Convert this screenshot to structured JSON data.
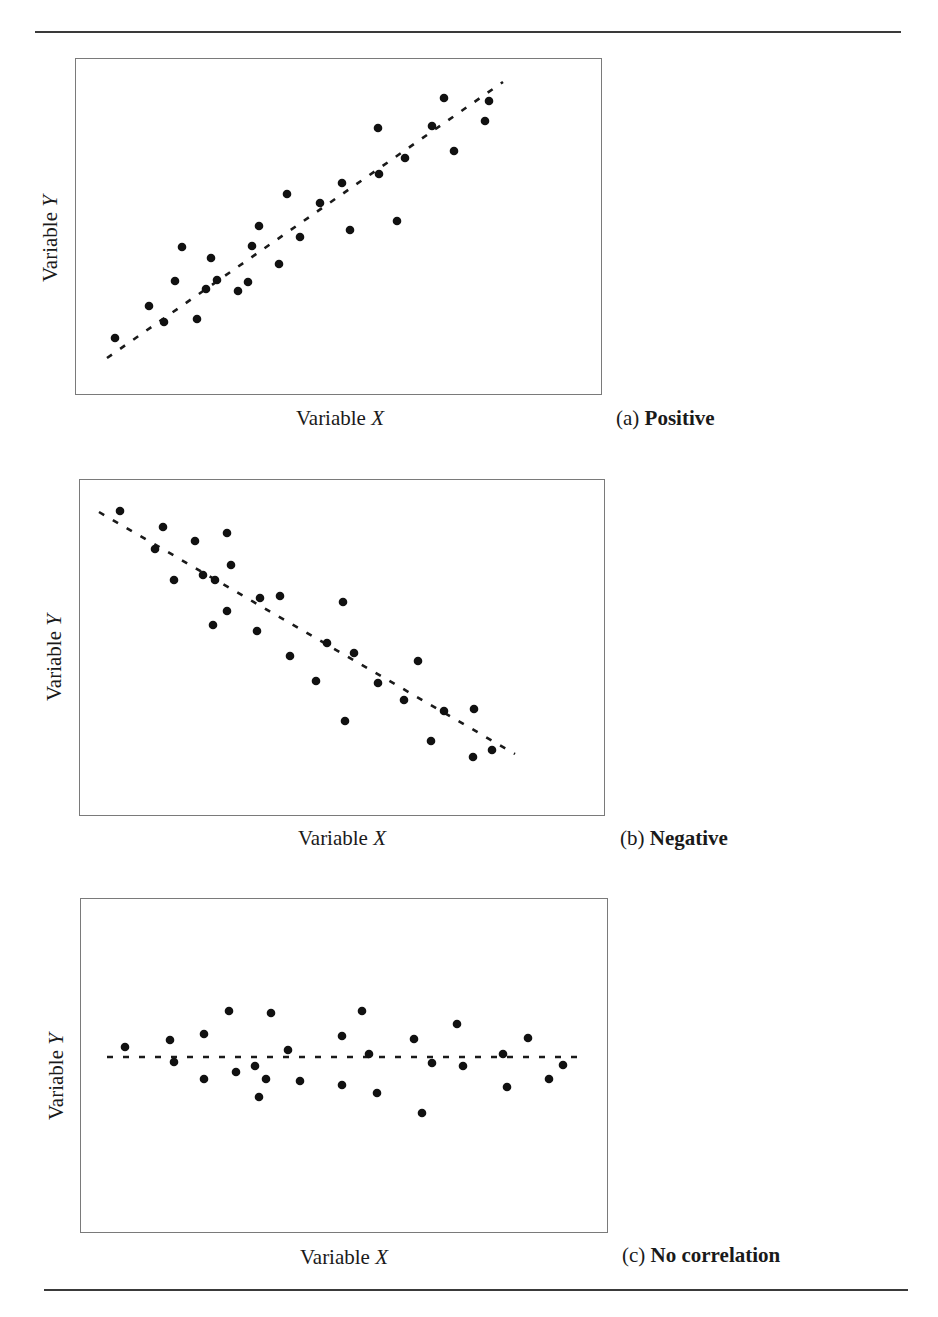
{
  "figure": {
    "panels": [
      {
        "id": "a",
        "caption_letter": "(a)",
        "caption_text": "Positive",
        "xlabel_prefix": "Variable ",
        "xlabel_var": "X",
        "ylabel_prefix": "Variable ",
        "ylabel_var": "Y"
      },
      {
        "id": "b",
        "caption_letter": "(b)",
        "caption_text": "Negative",
        "xlabel_prefix": "Variable ",
        "xlabel_var": "X",
        "ylabel_prefix": "Variable ",
        "ylabel_var": "Y"
      },
      {
        "id": "c",
        "caption_letter": "(c)",
        "caption_text": "No correlation",
        "xlabel_prefix": "Variable ",
        "xlabel_var": "X",
        "ylabel_prefix": "Variable ",
        "ylabel_var": "Y"
      }
    ]
  },
  "chart_data": [
    {
      "type": "scatter",
      "title": "(a) Positive",
      "xlabel": "Variable X",
      "ylabel": "Variable Y",
      "grid": false,
      "box": {
        "x": 75,
        "y": 58,
        "w": 527,
        "h": 337
      },
      "trendline": {
        "style": "dashed",
        "x1": 107,
        "y1": 358,
        "x2": 503,
        "y2": 82
      },
      "points_px": [
        [
          115,
          338
        ],
        [
          149,
          306
        ],
        [
          164,
          322
        ],
        [
          175,
          281
        ],
        [
          182,
          247
        ],
        [
          197,
          319
        ],
        [
          206,
          289
        ],
        [
          211,
          258
        ],
        [
          217,
          280
        ],
        [
          238,
          291
        ],
        [
          248,
          282
        ],
        [
          252,
          246
        ],
        [
          259,
          226
        ],
        [
          279,
          264
        ],
        [
          287,
          194
        ],
        [
          300,
          237
        ],
        [
          320,
          203
        ],
        [
          342,
          183
        ],
        [
          350,
          230
        ],
        [
          378,
          128
        ],
        [
          379,
          174
        ],
        [
          397,
          221
        ],
        [
          405,
          158
        ],
        [
          432,
          126
        ],
        [
          444,
          98
        ],
        [
          454,
          151
        ],
        [
          485,
          121
        ],
        [
          489,
          101
        ]
      ]
    },
    {
      "type": "scatter",
      "title": "(b) Negative",
      "xlabel": "Variable X",
      "ylabel": "Variable Y",
      "grid": false,
      "box": {
        "x": 79,
        "y": 479,
        "w": 526,
        "h": 337
      },
      "trendline": {
        "style": "dashed",
        "x1": 99,
        "y1": 512,
        "x2": 515,
        "y2": 754
      },
      "points_px": [
        [
          120,
          511
        ],
        [
          155,
          549
        ],
        [
          163,
          527
        ],
        [
          174,
          580
        ],
        [
          195,
          541
        ],
        [
          203,
          575
        ],
        [
          213,
          625
        ],
        [
          215,
          580
        ],
        [
          227,
          533
        ],
        [
          227,
          611
        ],
        [
          231,
          565
        ],
        [
          257,
          631
        ],
        [
          260,
          598
        ],
        [
          280,
          596
        ],
        [
          290,
          656
        ],
        [
          316,
          681
        ],
        [
          327,
          643
        ],
        [
          343,
          602
        ],
        [
          345,
          721
        ],
        [
          354,
          653
        ],
        [
          378,
          683
        ],
        [
          404,
          700
        ],
        [
          418,
          661
        ],
        [
          431,
          741
        ],
        [
          444,
          711
        ],
        [
          473,
          757
        ],
        [
          474,
          709
        ],
        [
          492,
          750
        ]
      ]
    },
    {
      "type": "scatter",
      "title": "(c) No correlation",
      "xlabel": "Variable X",
      "ylabel": "Variable Y",
      "grid": false,
      "box": {
        "x": 80,
        "y": 898,
        "w": 528,
        "h": 335
      },
      "trendline": {
        "style": "dashed",
        "x1": 107,
        "y1": 1057,
        "x2": 585,
        "y2": 1057
      },
      "points_px": [
        [
          125,
          1047
        ],
        [
          170,
          1040
        ],
        [
          174,
          1062
        ],
        [
          204,
          1034
        ],
        [
          204,
          1079
        ],
        [
          229,
          1011
        ],
        [
          236,
          1072
        ],
        [
          255,
          1066
        ],
        [
          259,
          1097
        ],
        [
          266,
          1079
        ],
        [
          271,
          1013
        ],
        [
          288,
          1050
        ],
        [
          300,
          1081
        ],
        [
          342,
          1036
        ],
        [
          342,
          1085
        ],
        [
          362,
          1011
        ],
        [
          369,
          1054
        ],
        [
          377,
          1093
        ],
        [
          414,
          1039
        ],
        [
          422,
          1113
        ],
        [
          432,
          1063
        ],
        [
          457,
          1024
        ],
        [
          463,
          1066
        ],
        [
          503,
          1054
        ],
        [
          507,
          1087
        ],
        [
          528,
          1038
        ],
        [
          549,
          1079
        ],
        [
          563,
          1065
        ]
      ]
    }
  ]
}
